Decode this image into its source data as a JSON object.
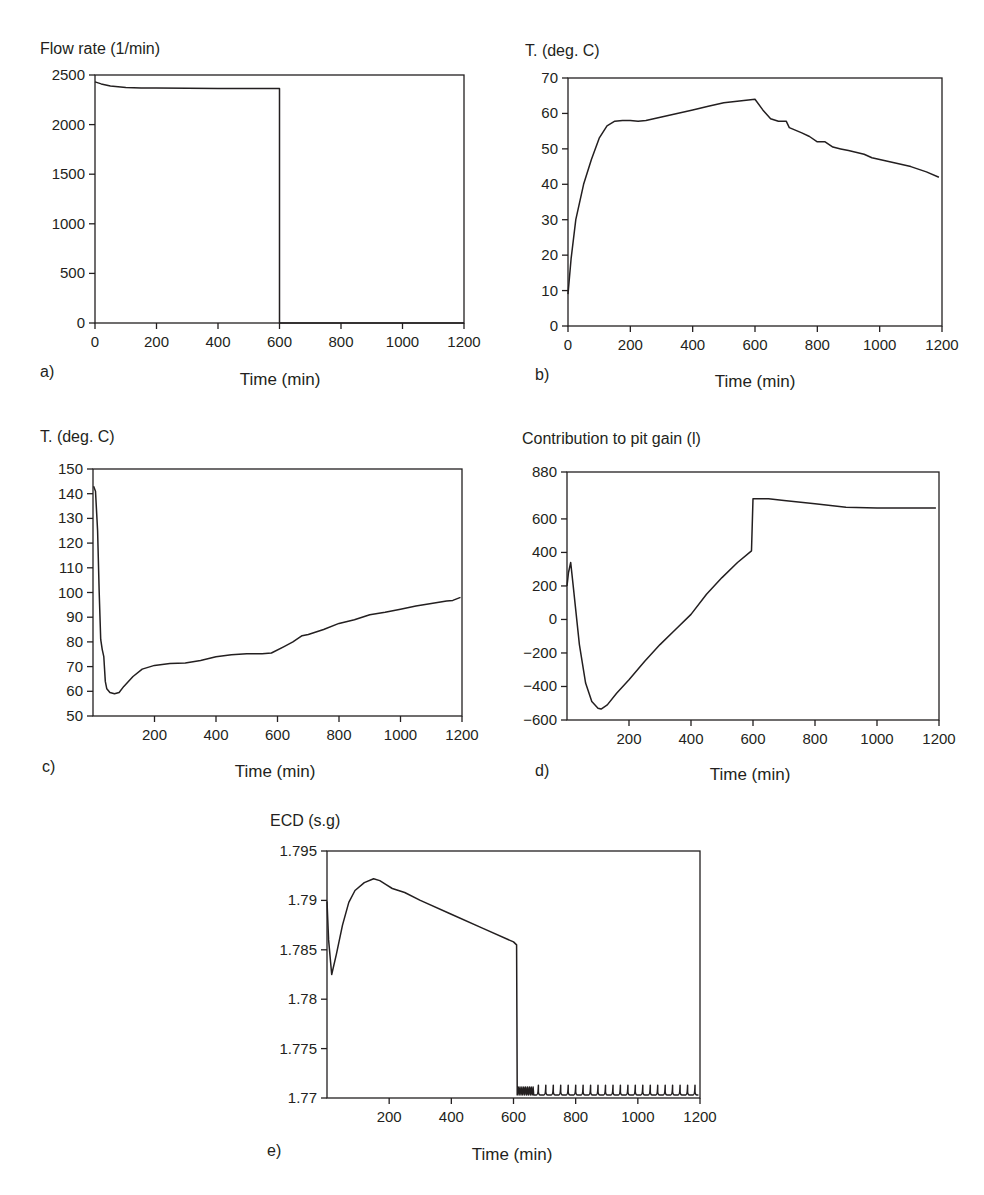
{
  "chart_data": [
    {
      "id": "a",
      "type": "line",
      "panel_label": "a)",
      "title": "Flow rate (1/min)",
      "xlabel": "Time (min)",
      "ylabel": "Flow rate (1/min)",
      "xlim": [
        0,
        1200
      ],
      "ylim": [
        0,
        2500
      ],
      "xticks": [
        0,
        200,
        400,
        600,
        800,
        1000,
        1200
      ],
      "yticks": [
        0,
        500,
        1000,
        1500,
        2000,
        2500
      ],
      "ytick_labels": [
        "0",
        "500",
        "1000",
        "1500",
        "2000",
        "2500"
      ],
      "grid": false,
      "frame": {
        "left": 95,
        "top": 75,
        "right": 464,
        "bottom": 323
      },
      "series": [
        {
          "name": "Flow rate",
          "x": [
            0,
            20,
            50,
            100,
            150,
            200,
            300,
            400,
            500,
            600,
            600,
            700,
            800,
            900,
            1000,
            1100,
            1200
          ],
          "y": [
            2430,
            2410,
            2390,
            2375,
            2370,
            2368,
            2366,
            2365,
            2365,
            2365,
            0,
            0,
            0,
            0,
            0,
            0,
            0
          ]
        }
      ]
    },
    {
      "id": "b",
      "type": "line",
      "panel_label": "b)",
      "title": "T. (deg. C)",
      "xlabel": "Time (min)",
      "ylabel": "T. (deg. C)",
      "xlim": [
        0,
        1200
      ],
      "ylim": [
        0,
        70
      ],
      "xticks": [
        0,
        200,
        400,
        600,
        800,
        1000,
        1200
      ],
      "yticks": [
        0,
        10,
        20,
        30,
        40,
        50,
        60,
        70
      ],
      "ytick_labels": [
        "0",
        "10",
        "20",
        "30",
        "40",
        "50",
        "60",
        "70"
      ],
      "grid": false,
      "frame": {
        "left": 568,
        "top": 78,
        "right": 942,
        "bottom": 326
      },
      "series": [
        {
          "name": "Temperature",
          "x": [
            0,
            10,
            25,
            50,
            75,
            100,
            125,
            150,
            175,
            200,
            225,
            250,
            300,
            350,
            400,
            450,
            500,
            550,
            600,
            625,
            650,
            675,
            700,
            710,
            750,
            775,
            800,
            825,
            850,
            875,
            900,
            950,
            975,
            1000,
            1050,
            1100,
            1150,
            1190
          ],
          "y": [
            9,
            19,
            30,
            40,
            47,
            53,
            56.5,
            57.8,
            58,
            58,
            57.8,
            58,
            59,
            60,
            61,
            62,
            63,
            63.5,
            64,
            61,
            58.5,
            57.8,
            57.8,
            56,
            54.5,
            53.5,
            52,
            52,
            50.5,
            50,
            49.5,
            48.5,
            47.5,
            47,
            46,
            45,
            43.5,
            42
          ]
        }
      ]
    },
    {
      "id": "c",
      "type": "line",
      "panel_label": "c)",
      "title": "T. (deg. C)",
      "xlabel": "Time (min)",
      "ylabel": "T. (deg. C)",
      "xlim": [
        0,
        1200
      ],
      "ylim": [
        50,
        150
      ],
      "xticks": [
        200,
        400,
        600,
        800,
        1000,
        1200
      ],
      "yticks": [
        50,
        60,
        70,
        80,
        90,
        100,
        110,
        120,
        130,
        140,
        150
      ],
      "ytick_labels": [
        "50",
        "60",
        "70",
        "80",
        "90",
        "100",
        "110",
        "120",
        "130",
        "140",
        "150"
      ],
      "grid": false,
      "frame": {
        "left": 93,
        "top": 469,
        "right": 462,
        "bottom": 716
      },
      "series": [
        {
          "name": "Temperature",
          "x": [
            2,
            8,
            15,
            20,
            25,
            30,
            35,
            40,
            45,
            55,
            70,
            85,
            100,
            130,
            160,
            200,
            250,
            300,
            350,
            400,
            450,
            500,
            550,
            580,
            620,
            650,
            680,
            700,
            750,
            800,
            850,
            900,
            950,
            1000,
            1050,
            1100,
            1150,
            1170,
            1195
          ],
          "y": [
            143,
            141,
            125,
            100,
            81,
            77,
            74,
            64,
            61,
            59.5,
            59,
            59.5,
            62,
            66,
            69,
            70.5,
            71.2,
            71.5,
            72.5,
            74,
            74.8,
            75.2,
            75.2,
            75.5,
            78,
            80,
            82.5,
            83,
            85,
            87.5,
            89,
            91,
            92,
            93.2,
            94.5,
            95.5,
            96.5,
            96.8,
            98
          ]
        }
      ]
    },
    {
      "id": "d",
      "type": "line",
      "panel_label": "d)",
      "title": "Contribution to pit gain (l)",
      "xlabel": "Time (min)",
      "ylabel": "Contribution to pit gain (l)",
      "xlim": [
        0,
        1200
      ],
      "ylim": [
        -600,
        880
      ],
      "xticks": [
        200,
        400,
        600,
        800,
        1000,
        1200
      ],
      "yticks": [
        -600,
        -400,
        -200,
        0,
        200,
        400,
        600,
        880
      ],
      "ytick_labels": [
        "−600",
        "−400",
        "−200",
        "0",
        "200",
        "400",
        "600",
        "880"
      ],
      "grid": false,
      "frame": {
        "left": 567,
        "top": 472,
        "right": 939,
        "bottom": 720
      },
      "series": [
        {
          "name": "Pit gain contribution",
          "x": [
            0,
            5,
            12,
            20,
            40,
            60,
            80,
            100,
            110,
            130,
            160,
            200,
            250,
            300,
            350,
            400,
            450,
            500,
            550,
            595,
            600,
            605,
            650,
            700,
            800,
            900,
            1000,
            1100,
            1190
          ],
          "y": [
            200,
            280,
            340,
            200,
            -150,
            -380,
            -490,
            -530,
            -535,
            -510,
            -440,
            -360,
            -250,
            -150,
            -60,
            30,
            150,
            250,
            340,
            410,
            720,
            720,
            720,
            710,
            690,
            670,
            665,
            665,
            665
          ]
        }
      ]
    },
    {
      "id": "e",
      "type": "line",
      "panel_label": "e)",
      "title": "ECD (s.g)",
      "xlabel": "Time (min)",
      "ylabel": "ECD (s.g)",
      "xlim": [
        0,
        1200
      ],
      "ylim": [
        1.77,
        1.795
      ],
      "xticks": [
        200,
        400,
        600,
        800,
        1000,
        1200
      ],
      "yticks": [
        1.77,
        1.775,
        1.78,
        1.785,
        1.79,
        1.795
      ],
      "ytick_labels": [
        "1.77",
        "1.775",
        "1.78",
        "1.785",
        "1.79",
        "1.795"
      ],
      "grid": false,
      "frame": {
        "left": 327,
        "top": 851,
        "right": 700,
        "bottom": 1098
      },
      "series": [
        {
          "name": "ECD",
          "x": [
            0,
            5,
            15,
            30,
            50,
            70,
            90,
            120,
            150,
            170,
            190,
            210,
            250,
            300,
            400,
            500,
            600,
            610,
            612
          ],
          "y": [
            1.7899,
            1.786,
            1.7825,
            1.7845,
            1.7875,
            1.7898,
            1.791,
            1.7918,
            1.7922,
            1.792,
            1.7916,
            1.7912,
            1.7908,
            1.79,
            1.7886,
            1.7872,
            1.7858,
            1.7855,
            1.771
          ],
          "after_drop": {
            "baseline": 1.7703,
            "noisy_region": [
              612,
              665
            ],
            "spike_start": 680,
            "spike_spacing": 24,
            "spike_height": 1.7713,
            "end": 1195
          }
        }
      ]
    }
  ]
}
